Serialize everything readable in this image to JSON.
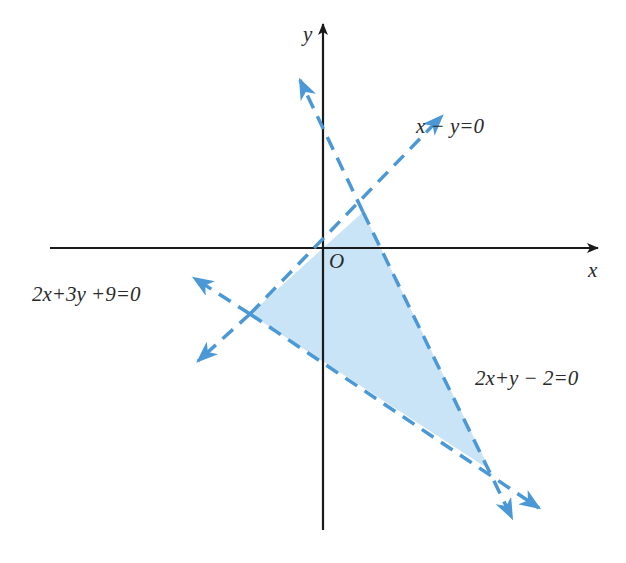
{
  "diagram": {
    "type": "linear-inequality-region",
    "axes": {
      "x_label": "x",
      "y_label": "y",
      "origin_label": "O"
    },
    "lines": [
      {
        "id": "line-x-minus-y",
        "equation": "x − y = 0",
        "label": "x − y=0"
      },
      {
        "id": "line-2x-plus-y-minus-2",
        "equation": "2x + y − 2 = 0",
        "label": "2x+y − 2=0"
      },
      {
        "id": "line-2x-plus-3y-plus-9",
        "equation": "2x + 3y + 9 = 0",
        "label": "2x+3y +9=0"
      }
    ],
    "shaded_region": {
      "description": "Triangle bounded by the three lines",
      "vertices": [
        [
          0.6667,
          0.6667
        ],
        [
          -1.8,
          -1.8
        ],
        [
          3.75,
          -5.5
        ]
      ]
    },
    "colors": {
      "axis": "#1a1a1a",
      "line": "#4a98d6",
      "fill": "#c5e3f6",
      "text": "#2a2a2a"
    }
  }
}
